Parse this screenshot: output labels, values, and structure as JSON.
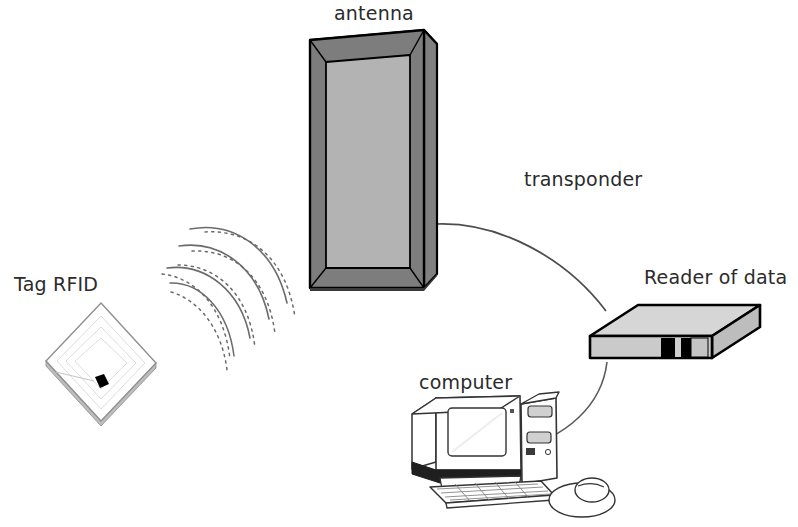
{
  "diagram": {
    "background_color": "#ffffff",
    "text_color": "#2b2b2b"
  },
  "labels": {
    "antenna": "antenna",
    "tag_rfid": "Tag RFID",
    "transponder": "transponder",
    "reader_of_data": "Reader of data",
    "computer": "computer"
  },
  "components": {
    "antenna": {
      "name": "antenna",
      "shape": "upright rectangular panel in 3D perspective",
      "frame_color": "#808080",
      "panel_color": "#b3b3b3",
      "outline_color": "#000000",
      "bounds": {
        "x": 310,
        "y": 30,
        "width": 128,
        "height": 258
      }
    },
    "tag": {
      "name": "Tag RFID",
      "shape": "white square card rotated to a diamond with embedded chip",
      "face_color": "#ffffff",
      "outline_color": "#9a9a9a",
      "chip_color": "#000000",
      "bounds": {
        "x": 46,
        "y": 303,
        "width": 110,
        "height": 118
      }
    },
    "reader": {
      "name": "Reader of data",
      "shape": "flat box in isometric perspective with front slots",
      "top_color": "#d4d4d4",
      "side_color": "#bdbdbd",
      "front_color": "#c9c9c9",
      "slot_color": "#000000",
      "outline_color": "#000000",
      "bounds": {
        "x": 588,
        "y": 305,
        "width": 172,
        "height": 62
      }
    },
    "computer": {
      "name": "computer",
      "shape": "CRT monitor with tower, keyboard and mouse",
      "outline_color": "#333333",
      "fill_color": "#ffffff",
      "shadow_color": "#1a1a1a",
      "bounds": {
        "x": 404,
        "y": 396,
        "width": 190,
        "height": 115
      }
    },
    "radio_waves": {
      "name": "radio-waves",
      "description": "alternating solid and dashed arcs between tag and antenna",
      "stroke_color": "#6b6b6b",
      "arc_count": 6
    },
    "transponder_link": {
      "name": "transponder-link",
      "description": "curve from antenna edge to reader of data",
      "stroke_color": "#4d4d4d"
    },
    "reader_computer_link": {
      "name": "reader-computer-link",
      "description": "curve from reader of data down to computer",
      "stroke_color": "#5a5a5a"
    }
  }
}
